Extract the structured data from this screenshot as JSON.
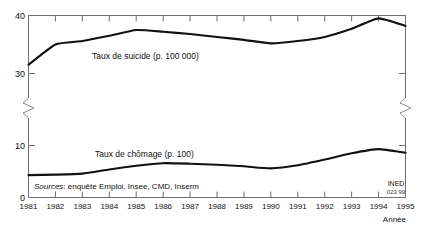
{
  "chart_data": {
    "type": "line",
    "title": "",
    "xlabel": "Année",
    "ylabel": "",
    "x": [
      1981,
      1982,
      1983,
      1984,
      1985,
      1986,
      1987,
      1988,
      1989,
      1990,
      1991,
      1992,
      1993,
      1994,
      1995
    ],
    "xticklabels": [
      "1981",
      "1982",
      "1983",
      "1984",
      "1985",
      "1986",
      "1987",
      "1988",
      "1989",
      "1990",
      "1991",
      "1992",
      "1993",
      "1994",
      "1995"
    ],
    "xlim": [
      1981,
      1995
    ],
    "ylim": [
      0,
      40
    ],
    "yticks": [
      0,
      10,
      30,
      40
    ],
    "yticklabels": [
      "0",
      "10",
      "30",
      "40"
    ],
    "axis_break": true,
    "axis_break_range": [
      10,
      30
    ],
    "grid": false,
    "legend": "inline-labels",
    "series": [
      {
        "name": "Taux de suicide (p. 100 000)",
        "label": "Taux de suicide (p. 100 000)",
        "unit": "p. 100 000",
        "color": "#111111",
        "values": [
          31.5,
          35.0,
          35.6,
          36.5,
          37.5,
          37.2,
          36.8,
          36.3,
          35.8,
          35.2,
          35.6,
          36.3,
          37.7,
          39.5,
          38.2
        ]
      },
      {
        "name": "Taux de chômage (p. 100)",
        "label": "Taux de chômage (p. 100)",
        "unit": "p. 100",
        "color": "#111111",
        "values": [
          4.3,
          4.4,
          4.6,
          5.4,
          6.1,
          6.6,
          6.5,
          6.3,
          6.0,
          5.6,
          6.2,
          7.3,
          8.5,
          9.3,
          8.6
        ]
      }
    ],
    "annotations": {
      "suicide_label": "Taux de suicide (p. 100 000)",
      "chomage_label": "Taux de chômage (p. 100)"
    }
  },
  "footer": {
    "sources_prefix": "Sources",
    "sources_text": ": enquête Emploi, Insee, CMD, Inserm",
    "ined_mark": "INED",
    "ined_code": "023 99"
  },
  "axes": {
    "x_axis_name": "Année",
    "y_tick_40": "40",
    "y_tick_30": "30",
    "y_tick_10": "10",
    "y_tick_0": "0"
  },
  "colors": {
    "line": "#111111",
    "axis": "#6f6f6f",
    "background": "#ffffff"
  }
}
